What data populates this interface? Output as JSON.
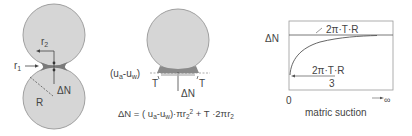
{
  "panel_a": {
    "label_r1": "r",
    "label_r1_sub": "1",
    "label_r2": "r",
    "label_r2_sub": "2",
    "label_R": "R",
    "label_dN": "ΔN"
  },
  "panel_b": {
    "label_suction": "(u",
    "label_suction_a": "a",
    "label_suction_mid": "-u",
    "label_suction_w": "w",
    "label_suction_end": ")",
    "label_T_left": "T",
    "label_T_right": "T",
    "label_dN": "ΔN",
    "equation": "ΔN = ( uₐ-uᵥ)·πr₂² + T ·2πr₂",
    "eq_part1": "ΔN = ( u",
    "eq_sub_a": "a",
    "eq_part2": "-u",
    "eq_sub_w": "w",
    "eq_part3": ")·πr",
    "eq_sub_2a": "2",
    "eq_sup_2": "2",
    "eq_part4": " + T ·2πr",
    "eq_sub_2b": "2"
  },
  "panel_c": {
    "y_label": "ΔN",
    "upper_asymptote": "2π·T·R",
    "lower_numerator": "2π·T·R",
    "lower_denominator": "3",
    "x_origin": "0",
    "x_infinity": "∞",
    "x_label": "matric suction"
  },
  "colors": {
    "sphere_fill": "#d6d6d6",
    "sphere_stroke": "#9a9a9a",
    "meniscus": "#777777",
    "line": "#555555"
  }
}
